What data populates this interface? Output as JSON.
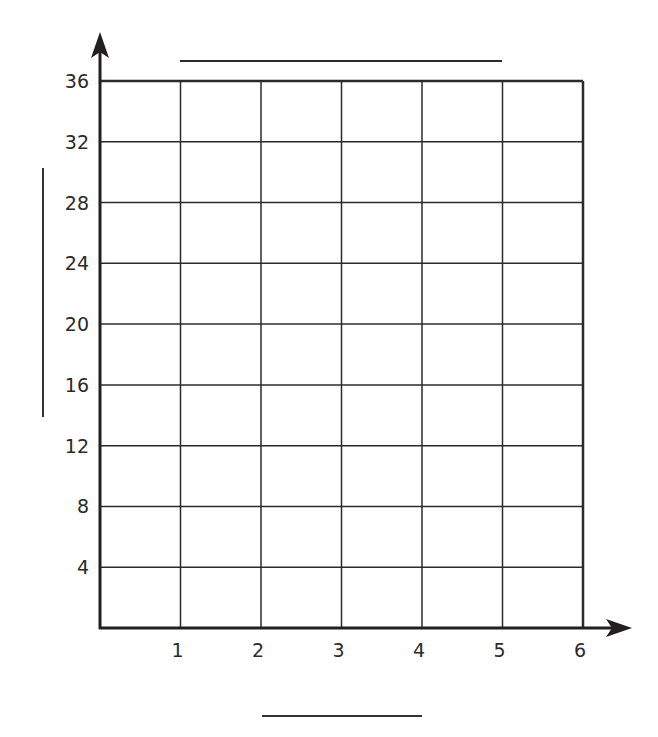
{
  "chart_data": {
    "type": "line",
    "title": "",
    "xlabel": "",
    "ylabel": "",
    "x_ticks": [
      1,
      2,
      3,
      4,
      5,
      6
    ],
    "y_ticks": [
      4,
      8,
      12,
      16,
      20,
      24,
      28,
      32,
      36
    ],
    "xlim": [
      0,
      6
    ],
    "ylim": [
      0,
      36
    ],
    "grid": true,
    "series": [],
    "blank_label_lines": [
      "title",
      "y-axis-label",
      "x-axis-label"
    ]
  },
  "colors": {
    "axis": "#231f20",
    "grid": "#2b2b2b",
    "label": "#2a2a2a",
    "background": "#ffffff"
  }
}
